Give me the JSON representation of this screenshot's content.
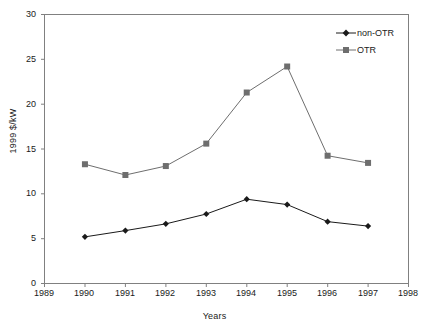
{
  "chart_data": {
    "type": "line",
    "title": "",
    "xlabel": "Years",
    "ylabel": "1999 $/kW",
    "xlim": [
      1989,
      1998
    ],
    "ylim": [
      0,
      30
    ],
    "xticks": [
      "1989",
      "1990",
      "1991",
      "1992",
      "1993",
      "1994",
      "1995",
      "1996",
      "1997",
      "1998"
    ],
    "yticks": [
      "0",
      "5",
      "10",
      "15",
      "20",
      "25",
      "30"
    ],
    "grid": false,
    "legend_position": "top-right",
    "x": [
      1990,
      1991,
      1992,
      1993,
      1994,
      1995,
      1996,
      1997
    ],
    "series": [
      {
        "name": "non-OTR",
        "marker": "diamond",
        "color": "#1a1a1a",
        "values": [
          5.2,
          5.9,
          6.65,
          7.75,
          9.4,
          8.8,
          6.9,
          6.4
        ]
      },
      {
        "name": "OTR",
        "marker": "square",
        "color": "#6e6e6e",
        "values": [
          13.3,
          12.1,
          13.1,
          15.6,
          21.3,
          24.2,
          14.25,
          13.45
        ]
      }
    ]
  },
  "axes": {
    "y_title": "1999 $/kW",
    "x_title": "Years"
  },
  "legend": {
    "items": [
      {
        "label": "non-OTR"
      },
      {
        "label": "OTR"
      }
    ]
  },
  "colors": {
    "series_non_otr": "#1a1a1a",
    "series_otr": "#6e6e6e",
    "frame": "#808080",
    "text": "#1a1a1a"
  }
}
